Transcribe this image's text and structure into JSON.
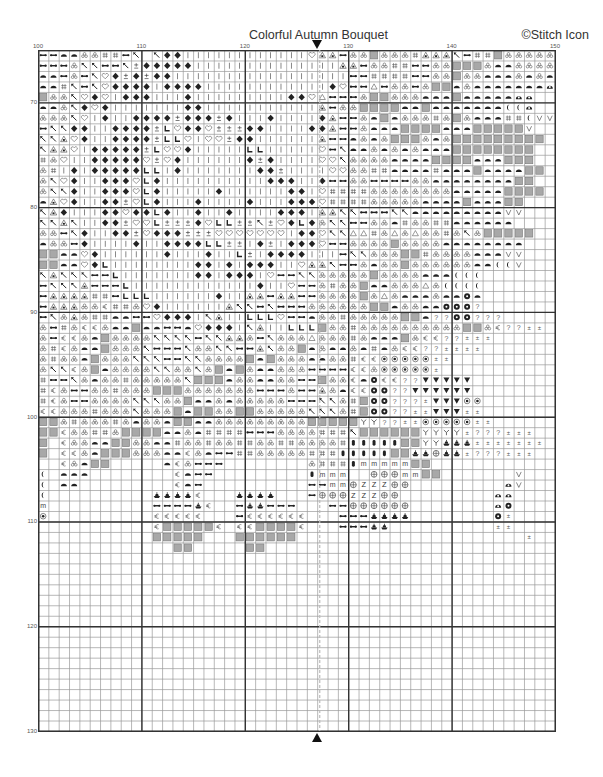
{
  "header": {
    "title": "Colorful Autumn Bouquet",
    "credit": "©Stitch Icon"
  },
  "chart_data": {
    "type": "table",
    "title": "Colorful Autumn Bouquet",
    "subtitle": "Cross-stitch pattern chart (page section)",
    "x_range": [
      100,
      150
    ],
    "y_range": [
      65,
      130
    ],
    "column_tick_labels": [
      "100",
      "110",
      "120",
      "130",
      "140",
      "150"
    ],
    "row_tick_labels": [
      "70",
      "80",
      "90",
      "100",
      "110",
      "120",
      "130"
    ],
    "center_marker_column": 125,
    "grid": true,
    "major_grid_every": 10,
    "legend_codes": {
      ".": "empty",
      "a": "double-arrow",
      "d": "dome",
      "b": "trefoil",
      "h": "hash",
      "k": "arrow-northwest",
      "p": "plus-minus",
      "D": "diamond",
      "i": "vertical-bar",
      "H": "heart",
      "t": "triangle-outline",
      "T": "triangle-filled-inner",
      "L": "corner-L",
      "g": "gray-square",
      "q": "quarter-moon",
      "e": "euro-c",
      "V": "v-check",
      "F": "flower",
      "Q": "question-mark",
      "z": "small-z",
      "o": "circle-dot",
      "W": "down-triangle",
      "Y": "y-fork",
      "B": "boat-bell",
      "R": "rounded-bar",
      "m": "letter-m",
      "C": "circle-cross",
      "Z": "letter-Z",
      "x": "bowl"
    },
    "rows": [
      "aaddbbhhak kDDiiiiiiiiiiiiHTTabbgbbbhTTTkahhgbbbbbqqq",
      "aaabkkaakpDDDDDiiiiiiiiiiiiiiTTabbhhaabbgggbddbbbbb",
      "ddabakHDpDpDDiiiiiiiiiiiiiiiiiaahhhhaabbgbbdddbdbdd",
      "ddhkakHDDDDiDDDDiiiiiiiiiiiiDHaatabbabggdbdddddddx",
      "gbbkHDHiDDDiiiDiiiiiiiiiDDHtaaabggbbbdddgdddddxx",
      "ddbkDHDiiiiiiiDDiiiiiiiiiiiTabbggggddgdddddddqqx",
      "bbbkHiDiiDDDDpDDDpDiiiDiiiiDTaabdgdbbbhbgbdddhhqVV",
      "akkDDiiDDDDpLHDDHpppDDiiiiDDTaabdddggggdddgggggV",
      "kkTHDiiDDDDpLLHiHHpDDiiiiiiTaadbdbgggbdbggggggggg",
      "kTTHiDDDDDpLHHDiiiiiLLiiiiiHakddbdbdbdddgggggggg",
      "hbHiiDDDDDHpHDiiiiiiDpDiiiiHHkbbbbddddggggdddggg",
      "bhiDiDDDDDLLiDiiiiiiiDDpiiiiHHbbhhddddhdddgddddgg",
      "bkHDiiDDDHLDiiiiiiiiiiDDDiiDaabbaaaabbddddddddgg",
      "bkkDiiDDDHLDiiiiiDiiiiiiDDiHhhhhbbbbbbbbdddddgggg",
      "dTHDiiDDpHLDiiiDiiiiDiiiDDDHhhhhbbbbbddddgdddgg",
      "kTDiiiDDHDDLDiiDiiDiiiiDDDiTTkkaaakkdddddddddVV",
      "kkTkiiDDpHHLpppDHLLppkpHDLDbkkaabbdhbbhhdddddd",
      "bbakDiiDDpHDDDpppHHHHHHHiDDHkktthbtbtbbhbkbggggg",
      "dbbaDiiiiDiiDDDDLLppiDpiDDDHaabbbbgbbbbdddddddd",
      "ggddHDiiiiiiDiiiDiiLpiDDDDiiiakkbbbgghbbbbdddVV",
      "ggddHDLiiiiiiiiDDiDiDDDiiHTTkaabdbbgbbbbbbddqqV",
      "kTkkkaaLiiiiiiiDDiDDDiHaakkbbbbbgbbbbdddqqq",
      "akkkTaaaLiiiiiiiiiiiiDiiHaabhbbgddbbbtbqqqq",
      "aTTTThhaLLLiiiiiiDiiTTaTTaabbbbgbtbdddbddFd",
      "aTTTbbehhbHDiiiiiiTkkakaaabbbbbbggdbbddFFFQ",
      "akbTbhhddaaHDDDikTiiLLLHaadbbhbbbbbggdQQFFQQQ",
      "bahbeebddgddaadHDDDikTiiLLLgbbhbbbbbbbbbbggbeQQzz",
      "baeebdgbbbbkkkkakkTTbakbbbtbbbhbdddgbeeQQzzz",
      "bhebddgbbbkaaakbbkkaaTkbbgdbddbdhdbeeQQzzzz",
      "bhbbdgbbbkkkaakkbbbbgdgbbbddbbheeooooozz",
      "bkkebgdbbbbkkbbkbgdgbddbbbaaaaeeboooooz",
      "haakbdbbhbbbbbkgggdbbddbbaagbbedFeeQQWWWWW",
      "hebaabbhbbbgggbbbbbbbaaabaaTbdeeFFQQWWWWWW",
      "hebaabbbbkkkbbgddbdbbbbbaaakkbhgFFQQQzWWWoo",
      "eebbbhbbbkbbbgdggbbggbbbbbkkkbhgFFQQzzWWWzz",
      "ggbhbbbhbdbbdggddbbbbbbbbbgggggYYQQzzooooozz",
      "ggebbhhbggggddbdhhhhaaabbbbhhhkggggggYYYYzQQQzzz",
      "g.ebbddggbbddhbbhbbhhbbhhbbbbhRRRRRggYYBBBzzzzzzz",
      "g.eebdgggbbbddebdaahhbbbbbhhhRRRRRggBBCBBzQQQzzz",
      "..ebdgg.....debaaa........bhhhRmmmmmgg.......",
      "q.ddd........edaa.........Rmmm..CCCmmgg.......V",
      "q.dd.........eda..........aammCZZZCC.........xV",
      "q..........BBBBe...BBBB...aCCCZZZCC.........xx",
      "m..........aaaaBe..aBBaaa...aaCCCCCC........xF",
      "o..........eeeee...aeeeeee...aaaBBBB........Fz",
      "...........eggggge.eegggge...aaaBB..........zz",
      "...........ggggg...gggggg......................z",
      ".............gg.....gg.........................",
      "..................................................",
      "..................................................",
      "..................................................",
      "..................................................",
      "..................................................",
      "..................................................",
      "..................................................",
      "..................................................",
      "..................................................",
      "..................................................",
      "..................................................",
      "..................................................",
      "..................................................",
      "..................................................",
      "..................................................",
      "..................................................",
      ".................................................."
    ]
  },
  "colors": {
    "grid_line": "#9a9a9a",
    "major_grid_line": "#333333",
    "center_line": "#bbbbbb",
    "symbol": "#222222",
    "gray_fill": "#a8a8a8"
  }
}
